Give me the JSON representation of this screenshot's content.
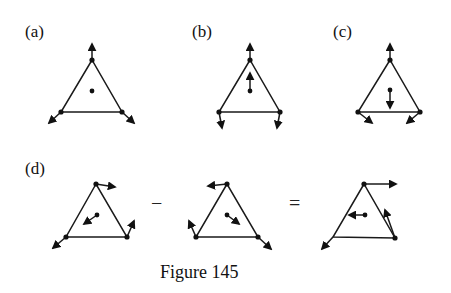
{
  "caption": "Figure 145",
  "panels": [
    {
      "id": "a",
      "label": "(a)"
    },
    {
      "id": "b",
      "label": "(b)"
    },
    {
      "id": "c",
      "label": "(c)"
    },
    {
      "id": "d",
      "label": "(d)"
    }
  ],
  "operators": {
    "minus": "−",
    "equals": "="
  },
  "colors": {
    "ink": "#1a1a1a",
    "background": "#ffffff"
  }
}
